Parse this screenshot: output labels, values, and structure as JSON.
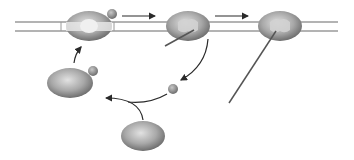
{
  "diagram": {
    "type": "ribosome-translation-cycle",
    "colors": {
      "background": "#ffffff",
      "strand": "#9a9a9a",
      "ribosome_dark": "#6e6e6e",
      "ribosome_light": "#d8d8d8",
      "arrow": "#2a2a2a",
      "protein_chain": "#555555",
      "factor_sphere": "#8e8e8e"
    },
    "elements": [
      {
        "id": "mrna-strand",
        "kind": "double-line"
      },
      {
        "id": "ribosome-initiating",
        "kind": "ribosome-open"
      },
      {
        "id": "ribosome-elongating",
        "kind": "ribosome-with-chain"
      },
      {
        "id": "ribosome-terminating",
        "kind": "ribosome-with-long-chain"
      },
      {
        "id": "free-ribosome-with-factor",
        "kind": "ribosome"
      },
      {
        "id": "free-ribosome",
        "kind": "ribosome"
      },
      {
        "id": "released-factor",
        "kind": "sphere"
      }
    ],
    "arrows": [
      {
        "from": "ribosome-initiating",
        "to": "ribosome-elongating"
      },
      {
        "from": "ribosome-elongating",
        "to": "ribosome-terminating"
      },
      {
        "from": "ribosome-elongating",
        "to": "released-factor"
      },
      {
        "from": "free-ribosome",
        "to": "free-ribosome-with-factor"
      },
      {
        "from": "free-ribosome-with-factor",
        "to": "ribosome-initiating"
      }
    ]
  }
}
